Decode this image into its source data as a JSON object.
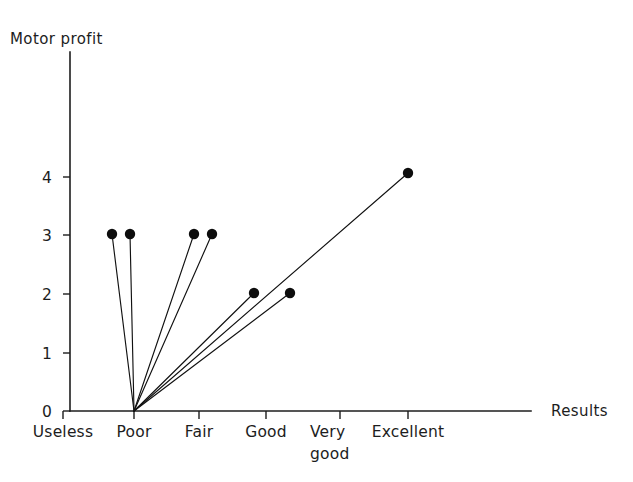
{
  "chart_data": {
    "type": "scatter",
    "title": "",
    "xlabel": "Results",
    "ylabel": "Motor profit",
    "categories": [
      "Useless",
      "Poor",
      "Fair",
      "Good",
      "Very good",
      "Excellent"
    ],
    "category_label_lines": [
      [
        "Useless"
      ],
      [
        "Poor"
      ],
      [
        "Fair"
      ],
      [
        "Good"
      ],
      [
        "Very",
        "good"
      ],
      [
        "Excellent"
      ]
    ],
    "ylim": [
      0,
      4.6
    ],
    "yticks": [
      0,
      1,
      2,
      3,
      4
    ],
    "ytick_labels": [
      "0",
      "1",
      "2",
      "3",
      "4"
    ],
    "grid": false,
    "legend": "none",
    "origin": {
      "x_category": "Poor",
      "x_value": 1.0,
      "y_value": 0
    },
    "points": [
      {
        "id": "p1",
        "x_value": 0.75,
        "y_value": 3,
        "label": "3"
      },
      {
        "id": "p2",
        "x_value": 1.0,
        "y_value": 3,
        "label": "3"
      },
      {
        "id": "p3",
        "x_value": 1.92,
        "y_value": 3,
        "label": "3"
      },
      {
        "id": "p4",
        "x_value": 2.18,
        "y_value": 3,
        "label": "3"
      },
      {
        "id": "p5",
        "x_value": 2.78,
        "y_value": 2,
        "label": "2"
      },
      {
        "id": "p6",
        "x_value": 3.28,
        "y_value": 2,
        "label": "2"
      },
      {
        "id": "p7",
        "x_value": 5.0,
        "y_value": 4,
        "label": "4"
      }
    ],
    "series": [
      {
        "name": "rays",
        "from": {
          "x_value": 1.0,
          "y_value": 0
        },
        "to": [
          {
            "x_value": 0.75,
            "y_value": 3
          },
          {
            "x_value": 1.0,
            "y_value": 3
          },
          {
            "x_value": 1.92,
            "y_value": 3
          },
          {
            "x_value": 2.18,
            "y_value": 3
          },
          {
            "x_value": 2.78,
            "y_value": 2
          },
          {
            "x_value": 3.28,
            "y_value": 2
          },
          {
            "x_value": 5.0,
            "y_value": 4
          }
        ]
      }
    ],
    "colors": {
      "line": "#111111",
      "marker": "#0d0d0d",
      "axis": "#1d1d1d",
      "background": "#ffffff"
    }
  },
  "geometry": {
    "y_axis_x": 70,
    "x_axis_y": 411,
    "y_axis_top": 52,
    "x_axis_right": 531,
    "unit_y_px": 58.3,
    "tick_x_px": [
      63,
      134,
      199,
      266,
      340,
      408
    ],
    "tick_y_px": [
      411,
      353,
      294,
      235,
      177
    ],
    "marker_radius": 5.2,
    "points_px": [
      {
        "x": 112,
        "y": 234
      },
      {
        "x": 130,
        "y": 234
      },
      {
        "x": 194,
        "y": 234
      },
      {
        "x": 212,
        "y": 234
      },
      {
        "x": 254,
        "y": 293
      },
      {
        "x": 290,
        "y": 293
      },
      {
        "x": 408,
        "y": 173
      }
    ],
    "origin_px": {
      "x": 134,
      "y": 411
    },
    "y_label_px": {
      "x": 60,
      "y": 240
    },
    "x_label_px": {
      "x": 551,
      "y": 411
    },
    "ytick_label_x": 52,
    "xtick_label_y1": 437,
    "xtick_label_y2": 459
  }
}
